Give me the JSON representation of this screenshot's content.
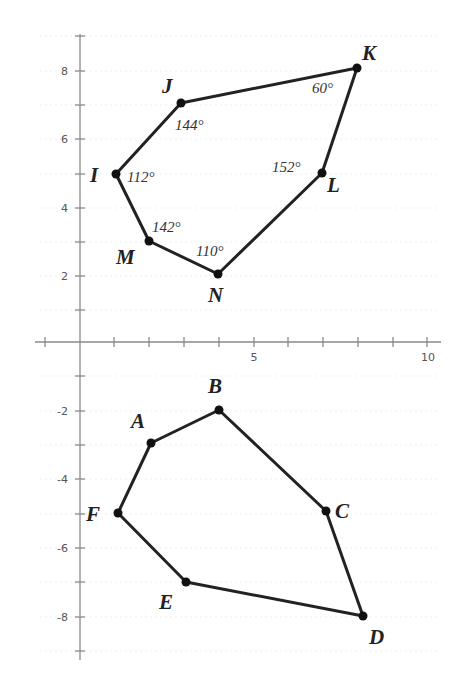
{
  "figure": {
    "type": "coordinate-plane-polygons",
    "axes": {
      "x_range": [
        -1,
        10.4
      ],
      "y_range": [
        -9.5,
        9.1
      ],
      "x_tick_labels": [
        {
          "value": 5,
          "text": "5"
        },
        {
          "value": 10,
          "text": "10"
        }
      ],
      "y_tick_labels": [
        {
          "value": 8,
          "text": "8"
        },
        {
          "value": 6,
          "text": "6"
        },
        {
          "value": 4,
          "text": "4"
        },
        {
          "value": 2,
          "text": "2"
        },
        {
          "value": -2,
          "text": "-2"
        },
        {
          "value": -4,
          "text": "-4"
        },
        {
          "value": -6,
          "text": "-6"
        },
        {
          "value": -8,
          "text": "-8"
        }
      ],
      "grid": true
    },
    "polygons": [
      {
        "name": "IJKLNM",
        "vertices": [
          {
            "label": "I",
            "x": 1,
            "y": 5,
            "angle": "112°"
          },
          {
            "label": "J",
            "x": 3,
            "y": 7,
            "angle": "144°"
          },
          {
            "label": "K",
            "x": 8,
            "y": 8,
            "angle": "60°"
          },
          {
            "label": "L",
            "x": 7,
            "y": 5,
            "angle": "152°"
          },
          {
            "label": "N",
            "x": 4,
            "y": 2,
            "angle": "110°"
          },
          {
            "label": "M",
            "x": 2,
            "y": 3,
            "angle": "142°"
          }
        ]
      },
      {
        "name": "ABCDEF",
        "vertices": [
          {
            "label": "A",
            "x": 2,
            "y": -3
          },
          {
            "label": "B",
            "x": 4,
            "y": -2
          },
          {
            "label": "C",
            "x": 7,
            "y": -5
          },
          {
            "label": "D",
            "x": 8,
            "y": -8
          },
          {
            "label": "E",
            "x": 3,
            "y": -7
          },
          {
            "label": "F",
            "x": 1,
            "y": -5
          }
        ]
      }
    ],
    "colors": {
      "line": "#222222",
      "axis": "#8a8a8a",
      "grid": "#ececec",
      "text": "#222222"
    }
  },
  "labels": {
    "x5": "5",
    "x10": "10",
    "y8": "8",
    "y6": "6",
    "y4": "4",
    "y2": "2",
    "yn2": "-2",
    "yn4": "-4",
    "yn6": "-6",
    "yn8": "-8",
    "I": "I",
    "J": "J",
    "K": "K",
    "L": "L",
    "M": "M",
    "N": "N",
    "A": "A",
    "B": "B",
    "C": "C",
    "D": "D",
    "E": "E",
    "F": "F",
    "angle_I": "112°",
    "angle_J": "144°",
    "angle_K": "60°",
    "angle_L": "152°",
    "angle_M": "142°",
    "angle_N": "110°"
  }
}
